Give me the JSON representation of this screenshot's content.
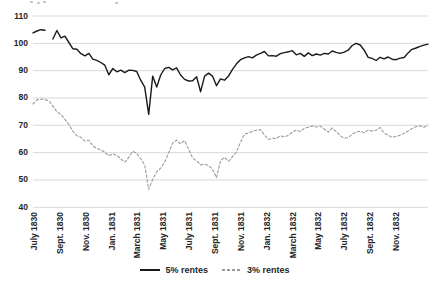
{
  "chart_data": {
    "type": "line",
    "title": "",
    "xlabel": "",
    "ylabel": "",
    "ylim": [
      40,
      110
    ],
    "y_ticks": [
      110,
      100,
      90,
      80,
      70,
      60,
      50,
      40
    ],
    "grid": "horizontal-only",
    "grid_color": "#d9d9d9",
    "legend_position": "bottom-center",
    "x_tick_labels": [
      "July 1830",
      "Sept. 1830",
      "Nov. 1830",
      "Jan. 1831",
      "March 1831",
      "May 1831",
      "July 1831",
      "Sept. 1831",
      "Nov. 1831",
      "Jan. 1832",
      "March 1832",
      "May 1832",
      "July 1832",
      "Sept. 1832",
      "Nov. 1832"
    ],
    "series": [
      {
        "name": "5% rentes",
        "style": "solid",
        "color": "#1a1a1a",
        "values": [
          103.8,
          104.5,
          105.0,
          104.8,
          null,
          101.6,
          104.7,
          102.0,
          102.6,
          100.3,
          98.0,
          97.8,
          96.2,
          95.4,
          96.3,
          94.2,
          93.8,
          93.0,
          92.0,
          88.5,
          90.8,
          89.6,
          90.2,
          89.3,
          90.2,
          90.1,
          89.7,
          86.5,
          84.0,
          74.0,
          88.0,
          84.0,
          88.4,
          90.8,
          91.2,
          90.3,
          91.0,
          88.4,
          86.8,
          86.2,
          86.3,
          87.8,
          82.3,
          88.0,
          89.1,
          88.0,
          84.5,
          87.0,
          86.5,
          88.0,
          90.5,
          92.5,
          94.0,
          94.7,
          95.1,
          94.7,
          95.7,
          96.3,
          97.0,
          95.4,
          95.5,
          95.3,
          96.2,
          96.6,
          96.9,
          97.3,
          95.8,
          96.3,
          95.2,
          96.5,
          95.5,
          96.1,
          95.7,
          96.3,
          96.1,
          97.2,
          96.7,
          96.3,
          96.8,
          97.5,
          99.2,
          100.0,
          99.4,
          97.5,
          94.9,
          94.5,
          93.7,
          94.9,
          94.3,
          95.0,
          94.2,
          94.0,
          94.6,
          94.8,
          96.5,
          97.8,
          98.3,
          98.9,
          99.3,
          99.7
        ]
      },
      {
        "name": "3% rentes",
        "style": "dashed",
        "color": "#9a9a9a",
        "values": [
          77.8,
          79.3,
          79.6,
          79.5,
          78.9,
          77.0,
          75.0,
          74.0,
          72.2,
          70.3,
          67.8,
          66.2,
          65.6,
          64.2,
          64.5,
          62.5,
          61.5,
          61.0,
          60.2,
          58.8,
          59.6,
          59.0,
          57.7,
          56.5,
          58.3,
          60.5,
          59.7,
          57.8,
          55.5,
          46.5,
          50.3,
          53.0,
          54.3,
          56.5,
          60.0,
          63.5,
          64.6,
          63.2,
          64.4,
          61.3,
          58.0,
          57.0,
          55.5,
          55.8,
          55.2,
          54.0,
          50.8,
          57.0,
          58.3,
          56.8,
          58.5,
          60.3,
          63.8,
          66.8,
          67.2,
          67.8,
          68.2,
          68.4,
          66.5,
          64.8,
          65.3,
          65.2,
          66.2,
          65.8,
          66.3,
          67.5,
          68.2,
          67.7,
          68.9,
          69.3,
          69.7,
          69.4,
          69.7,
          68.6,
          67.5,
          69.0,
          67.7,
          66.2,
          65.3,
          65.5,
          66.7,
          67.5,
          67.9,
          67.3,
          68.3,
          67.9,
          68.2,
          69.2,
          67.2,
          66.3,
          65.6,
          65.9,
          66.4,
          67.1,
          67.9,
          68.8,
          69.5,
          69.8,
          69.3,
          70.0
        ]
      }
    ]
  },
  "legend": {
    "items": [
      {
        "label": "5% rentes"
      },
      {
        "label": "3% rentes"
      }
    ]
  }
}
